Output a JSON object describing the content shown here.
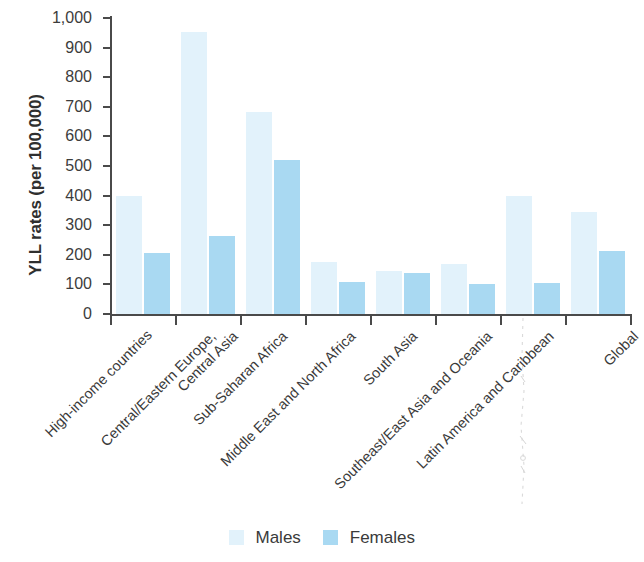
{
  "chart_data": {
    "type": "bar",
    "title": "",
    "xlabel": "",
    "ylabel": "YLL rates (per 100,000)",
    "ylim": [
      0,
      1000
    ],
    "ytick_labels": [
      "0",
      "100",
      "200",
      "300",
      "400",
      "500",
      "600",
      "700",
      "800",
      "900",
      "1,000"
    ],
    "ytick_values": [
      0,
      100,
      200,
      300,
      400,
      500,
      600,
      700,
      800,
      900,
      1000
    ],
    "grid": false,
    "legend_position": "bottom",
    "categories": [
      "High-income countries",
      "Central/Eastern Europe,\nCentral Asia",
      "Sub-Saharan Africa",
      "Middle East and North Africa",
      "South Asia",
      "Southeast/East Asia and Oceania",
      "Latin America and Caribbean",
      "Global"
    ],
    "category_labels": [
      "High-income countries",
      "Central/Eastern Europe,",
      "Central Asia",
      "Sub-Saharan Africa",
      "Middle East and North Africa",
      "South Asia",
      "Southeast/East Asia and Oceania",
      "Latin America and Caribbean",
      "Global"
    ],
    "series": [
      {
        "name": "Males",
        "color": "#e2f2fb",
        "values": [
          400,
          952,
          683,
          175,
          145,
          168,
          400,
          345
        ]
      },
      {
        "name": "Females",
        "color": "#a9d9f2",
        "values": [
          207,
          262,
          520,
          107,
          138,
          102,
          105,
          213
        ]
      }
    ]
  },
  "legend": {
    "items": [
      {
        "label": "Males",
        "color": "#e2f2fb"
      },
      {
        "label": "Females",
        "color": "#a9d9f2"
      }
    ]
  },
  "axis": {
    "y_title": "YLL rates (per 100,000)"
  }
}
